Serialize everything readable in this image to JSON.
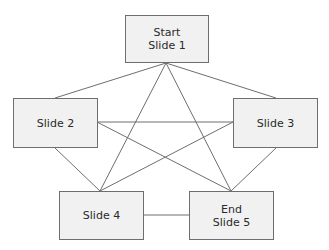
{
  "diagram": {
    "nodes": [
      {
        "id": "slide1",
        "lines": [
          "Start",
          "Slide 1"
        ],
        "box": [
          125,
          15,
          84,
          48
        ]
      },
      {
        "id": "slide2",
        "lines": [
          "Slide 2"
        ],
        "box": [
          13,
          98,
          85,
          50
        ]
      },
      {
        "id": "slide3",
        "lines": [
          "Slide 3"
        ],
        "box": [
          233,
          98,
          85,
          50
        ]
      },
      {
        "id": "slide4",
        "lines": [
          "Slide 4"
        ],
        "box": [
          59,
          191,
          85,
          49
        ]
      },
      {
        "id": "slide5",
        "lines": [
          "End",
          "Slide 5"
        ],
        "box": [
          189,
          191,
          85,
          49
        ]
      }
    ],
    "edges": [
      {
        "from": "slide1",
        "to": "slide2"
      },
      {
        "from": "slide1",
        "to": "slide3"
      },
      {
        "from": "slide1",
        "to": "slide4"
      },
      {
        "from": "slide1",
        "to": "slide5"
      },
      {
        "from": "slide2",
        "to": "slide3"
      },
      {
        "from": "slide2",
        "to": "slide4"
      },
      {
        "from": "slide2",
        "to": "slide5"
      },
      {
        "from": "slide3",
        "to": "slide4"
      },
      {
        "from": "slide3",
        "to": "slide5"
      },
      {
        "from": "slide4",
        "to": "slide5"
      }
    ],
    "colors": {
      "line": "#6e6e6e",
      "box_fill": "#f1f1f1",
      "box_border": "#6e6e6e",
      "text": "#2a2a2a"
    }
  }
}
